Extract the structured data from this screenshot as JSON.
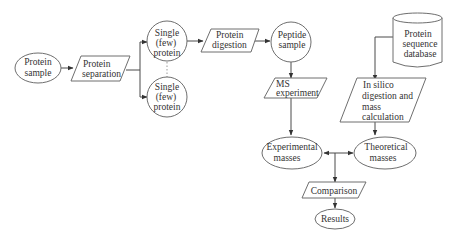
{
  "diagram": {
    "type": "flowchart",
    "nodes": {
      "protein_sample": {
        "shape": "ellipse",
        "lines": [
          "Protein",
          "sample"
        ]
      },
      "protein_separation": {
        "shape": "parallelogram",
        "lines": [
          "Protein",
          "separation"
        ]
      },
      "single_protein_1": {
        "shape": "circle",
        "lines": [
          "Single",
          "(few)",
          "protein"
        ]
      },
      "single_protein_2": {
        "shape": "circle",
        "lines": [
          "Single",
          "(few)",
          "protein"
        ]
      },
      "protein_digestion": {
        "shape": "parallelogram",
        "lines": [
          "Protein",
          "digestion"
        ]
      },
      "peptide_sample": {
        "shape": "circle",
        "lines": [
          "Peptide",
          "sample"
        ]
      },
      "ms_experiment": {
        "shape": "parallelogram",
        "lines": [
          "MS",
          "experiment"
        ]
      },
      "experimental_masses": {
        "shape": "ellipse",
        "lines": [
          "Experimental",
          "masses"
        ]
      },
      "protein_sequence_database": {
        "shape": "cylinder",
        "lines": [
          "Protein",
          "sequence",
          "database"
        ]
      },
      "in_silico_digestion": {
        "shape": "parallelogram",
        "lines": [
          "In silico",
          "digestion and",
          "mass",
          "calculation"
        ]
      },
      "theoretical_masses": {
        "shape": "ellipse",
        "lines": [
          "Theoretical",
          "masses"
        ]
      },
      "comparison": {
        "shape": "parallelogram",
        "lines": [
          "Comparison"
        ]
      },
      "results": {
        "shape": "ellipse",
        "lines": [
          "Results"
        ]
      }
    },
    "edges": [
      {
        "from": "protein_sample",
        "to": "protein_separation"
      },
      {
        "from": "protein_separation",
        "to": "single_protein_1"
      },
      {
        "from": "protein_separation",
        "to": "single_protein_2"
      },
      {
        "from": "single_protein_1",
        "to": "single_protein_2",
        "style": "dotted"
      },
      {
        "from": "single_protein_1",
        "to": "protein_digestion"
      },
      {
        "from": "protein_digestion",
        "to": "peptide_sample"
      },
      {
        "from": "peptide_sample",
        "to": "ms_experiment"
      },
      {
        "from": "ms_experiment",
        "to": "experimental_masses"
      },
      {
        "from": "protein_sequence_database",
        "to": "in_silico_digestion"
      },
      {
        "from": "in_silico_digestion",
        "to": "theoretical_masses"
      },
      {
        "from": "experimental_masses",
        "to": "comparison",
        "bidirectional_join": true
      },
      {
        "from": "theoretical_masses",
        "to": "comparison",
        "bidirectional_join": true
      },
      {
        "from": "comparison",
        "to": "results"
      }
    ]
  }
}
